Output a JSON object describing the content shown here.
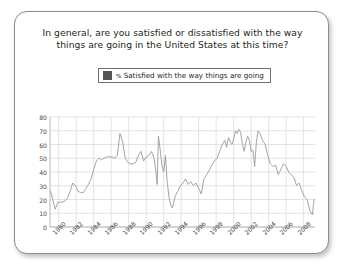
{
  "card": {
    "title_line1": "In general, are you satisfied or dissatisfied with the way",
    "title_line2": "things are going in the United States at this time?"
  },
  "legend": {
    "percent_symbol": "%",
    "label": "Satisfied with the way things are going",
    "swatch_color": "#555555"
  },
  "chart_data": {
    "type": "line",
    "title": "In general, are you satisfied or dissatisfied with the way things are going in the United States at this time?",
    "xlabel": "",
    "ylabel": "",
    "ylim": [
      0,
      80
    ],
    "ytick_values": [
      80,
      70,
      60,
      50,
      40,
      30,
      20,
      10,
      0
    ],
    "ytick_labels": [
      "80",
      "70",
      "60",
      "50",
      "40",
      "30",
      "20",
      "10",
      "0"
    ],
    "xlim": [
      1979.0,
      2009.3
    ],
    "xtick_values": [
      1980,
      1982,
      1984,
      1986,
      1988,
      1990,
      1992,
      1994,
      1996,
      1998,
      2000,
      2002,
      2004,
      2006,
      2008
    ],
    "xtick_labels": [
      "1980",
      "1982",
      "1984",
      "1986",
      "1988",
      "1990",
      "1992",
      "1994",
      "1996",
      "1998",
      "2000",
      "2002",
      "2004",
      "2006",
      "2008"
    ],
    "grid": true,
    "legend_position": "top-center",
    "line_color": "#9a9a9a",
    "series": [
      {
        "name": "% Satisfied with the way things are going",
        "x": [
          1979.05,
          1979.35,
          1979.6,
          1979.9,
          1980.15,
          1980.4,
          1980.7,
          1981.0,
          1981.3,
          1981.6,
          1981.9,
          1982.2,
          1982.5,
          1982.8,
          1983.1,
          1983.4,
          1983.7,
          1984.0,
          1984.3,
          1984.6,
          1984.9,
          1985.2,
          1985.5,
          1985.8,
          1986.1,
          1986.4,
          1986.7,
          1987.0,
          1987.3,
          1987.6,
          1987.9,
          1988.2,
          1988.5,
          1988.8,
          1989.1,
          1989.4,
          1989.7,
          1990.0,
          1990.3,
          1990.6,
          1990.9,
          1991.1,
          1991.25,
          1991.4,
          1991.6,
          1991.8,
          1992.0,
          1992.2,
          1992.4,
          1992.6,
          1992.8,
          1993.0,
          1993.3,
          1993.6,
          1993.9,
          1994.2,
          1994.5,
          1994.8,
          1995.1,
          1995.4,
          1995.7,
          1996.0,
          1996.3,
          1996.6,
          1996.9,
          1997.2,
          1997.5,
          1997.8,
          1998.1,
          1998.4,
          1998.7,
          1999.0,
          1999.2,
          1999.4,
          1999.6,
          1999.8,
          2000.0,
          2000.2,
          2000.4,
          2000.6,
          2000.8,
          2001.0,
          2001.2,
          2001.4,
          2001.6,
          2001.8,
          2002.0,
          2002.2,
          2002.4,
          2002.6,
          2002.8,
          2003.0,
          2003.3,
          2003.6,
          2003.9,
          2004.2,
          2004.5,
          2004.8,
          2005.1,
          2005.4,
          2005.7,
          2006.0,
          2006.3,
          2006.6,
          2006.9,
          2007.2,
          2007.5,
          2007.8,
          2008.1,
          2008.4,
          2008.7,
          2009.0,
          2009.2
        ],
        "y": [
          26,
          19,
          13,
          18,
          18,
          18,
          19,
          21,
          26,
          32,
          30,
          26,
          25,
          25,
          28,
          31,
          35,
          42,
          48,
          50,
          49,
          50,
          51,
          51,
          51,
          50,
          52,
          68,
          62,
          50,
          47,
          46,
          46,
          47,
          52,
          55,
          48,
          51,
          52,
          55,
          50,
          41,
          31,
          66,
          56,
          45,
          40,
          52,
          33,
          22,
          16,
          14,
          22,
          26,
          30,
          32,
          35,
          31,
          33,
          30,
          32,
          28,
          24,
          35,
          38,
          41,
          45,
          48,
          50,
          55,
          60,
          63,
          58,
          65,
          62,
          60,
          64,
          70,
          68,
          71,
          69,
          60,
          55,
          62,
          66,
          63,
          55,
          56,
          44,
          62,
          70,
          68,
          63,
          60,
          52,
          46,
          44,
          45,
          38,
          42,
          46,
          44,
          40,
          38,
          36,
          30,
          32,
          26,
          22,
          20,
          12,
          9,
          20
        ]
      }
    ]
  },
  "yaxis": {
    "ticks": [
      "80",
      "70",
      "60",
      "50",
      "40",
      "30",
      "20",
      "10",
      "0"
    ]
  },
  "xaxis": {
    "ticks": [
      "1980",
      "1982",
      "1984",
      "1986",
      "1988",
      "1990",
      "1992",
      "1994",
      "1996",
      "1998",
      "2000",
      "2002",
      "2004",
      "2006",
      "2008"
    ]
  }
}
